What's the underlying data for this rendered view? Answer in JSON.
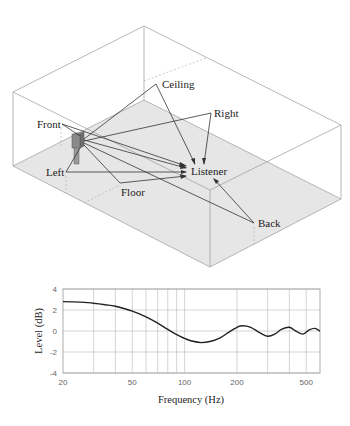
{
  "diagram": {
    "labels": {
      "ceiling": "Ceiling",
      "right": "Right",
      "front": "Front",
      "left": "Left",
      "floor": "Floor",
      "listener": "Listener",
      "back": "Back"
    },
    "colors": {
      "floor": "#e6e6e6",
      "edges": "#9a9a9a",
      "rays": "#333333",
      "speaker": "#8a8a8a"
    }
  },
  "chart_data": {
    "type": "line",
    "title": "",
    "xlabel": "Frequency (Hz)",
    "ylabel": "Level (dB)",
    "xscale": "log",
    "xlim": [
      20,
      600
    ],
    "ylim": [
      -4,
      4
    ],
    "grid": true,
    "legend": null,
    "x_ticks": [
      "20",
      "50",
      "100",
      "200",
      "500"
    ],
    "y_ticks": [
      "4",
      "2",
      "0",
      "-2",
      "-4"
    ],
    "series": [
      {
        "name": "Level",
        "x": [
          20,
          25,
          30,
          35,
          40,
          50,
          60,
          70,
          80,
          90,
          100,
          110,
          125,
          140,
          160,
          180,
          200,
          215,
          240,
          270,
          300,
          330,
          360,
          400,
          440,
          480,
          520,
          560,
          600
        ],
        "values": [
          2.8,
          2.75,
          2.65,
          2.5,
          2.35,
          1.9,
          1.35,
          0.75,
          0.15,
          -0.35,
          -0.7,
          -0.95,
          -1.1,
          -1.0,
          -0.65,
          -0.1,
          0.35,
          0.5,
          0.35,
          -0.15,
          -0.5,
          -0.3,
          0.15,
          0.35,
          -0.05,
          -0.3,
          0.1,
          0.25,
          0.0
        ]
      }
    ]
  }
}
